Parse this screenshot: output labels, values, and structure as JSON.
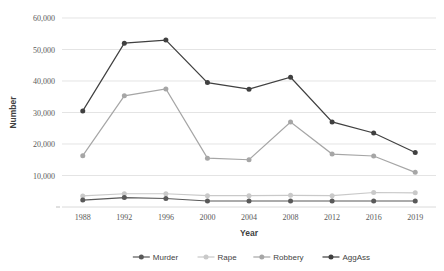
{
  "chart_data": {
    "type": "line",
    "title": "",
    "xlabel": "Year",
    "ylabel": "Number",
    "categories": [
      "1988",
      "1992",
      "1996",
      "2000",
      "2004",
      "2008",
      "2012",
      "2016",
      "2019"
    ],
    "ylim": [
      0,
      60000
    ],
    "yticks": [
      10000,
      20000,
      30000,
      40000,
      50000,
      60000
    ],
    "ytick_labels": [
      "10,000",
      "20,000",
      "30,000",
      "40,000",
      "50,000",
      "60,000"
    ],
    "grid": "horizontal",
    "legend_position": "bottom",
    "series": [
      {
        "name": "Murder",
        "color": "#595959",
        "values": [
          2200,
          3000,
          2700,
          1900,
          1900,
          1900,
          1900,
          1900,
          1900
        ]
      },
      {
        "name": "Rape",
        "color": "#c9c9c9",
        "values": [
          3500,
          4200,
          4200,
          3600,
          3600,
          3700,
          3600,
          4600,
          4500
        ]
      },
      {
        "name": "Robbery",
        "color": "#a6a6a6",
        "values": [
          16300,
          35300,
          37500,
          15500,
          15000,
          27000,
          16800,
          16200,
          11000
        ]
      },
      {
        "name": "AggAss",
        "color": "#404040",
        "values": [
          30500,
          52000,
          53000,
          39500,
          37400,
          41200,
          27000,
          23500,
          17300
        ]
      }
    ]
  }
}
